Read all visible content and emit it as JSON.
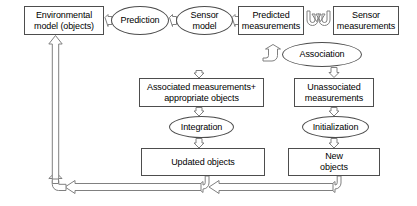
{
  "diagram": {
    "stroke_color": "#4d4d4d",
    "arrow_color": "#808080",
    "text_color": "#000000",
    "background": "#ffffff",
    "nodes": [
      {
        "id": "environmental-model",
        "label": "Environmental\nmodel (objects)",
        "shape": "box",
        "x": 24,
        "y": 6,
        "w": 80,
        "h": 29
      },
      {
        "id": "prediction",
        "label": "Prediction",
        "shape": "ellipse",
        "x": 111,
        "y": 6,
        "w": 58,
        "h": 29
      },
      {
        "id": "sensor-model",
        "label": "Sensor\nmodel",
        "shape": "ellipse",
        "x": 176,
        "y": 6,
        "w": 57,
        "h": 29
      },
      {
        "id": "predicted-measurements",
        "label": "Predicted\nmeasurements",
        "shape": "box",
        "x": 238,
        "y": 6,
        "w": 66,
        "h": 29
      },
      {
        "id": "sensor-measurements",
        "label": "Sensor\nmeasurements",
        "shape": "box",
        "x": 333,
        "y": 6,
        "w": 66,
        "h": 29
      },
      {
        "id": "association",
        "label": "Association",
        "shape": "ellipse",
        "x": 282,
        "y": 42,
        "w": 80,
        "h": 25
      },
      {
        "id": "associated-measurements",
        "label": "Associated measurements+\nappropriate objects",
        "shape": "box",
        "x": 139,
        "y": 78,
        "w": 125,
        "h": 29
      },
      {
        "id": "unassociated-measurements",
        "label": "Unassociated\nmeasurements",
        "shape": "box",
        "x": 294,
        "y": 78,
        "w": 80,
        "h": 29
      },
      {
        "id": "integration",
        "label": "Integration",
        "shape": "ellipse",
        "x": 169,
        "y": 116,
        "w": 65,
        "h": 22
      },
      {
        "id": "initialization",
        "label": "Initialization",
        "shape": "ellipse",
        "x": 302,
        "y": 116,
        "w": 67,
        "h": 22
      },
      {
        "id": "updated-objects",
        "label": "Updated objects",
        "shape": "box",
        "x": 141,
        "y": 148,
        "w": 124,
        "h": 28
      },
      {
        "id": "new-objects",
        "label": "New\nobjects",
        "shape": "box",
        "x": 288,
        "y": 148,
        "w": 92,
        "h": 28
      }
    ],
    "edges": [
      {
        "id": "env-to-prediction",
        "from": "environmental-model",
        "to": "prediction",
        "kind": "straight-right"
      },
      {
        "id": "prediction-to-sensor-model",
        "from": "prediction",
        "to": "sensor-model",
        "kind": "straight-right"
      },
      {
        "id": "sensor-model-to-predicted",
        "from": "sensor-model",
        "to": "predicted-measurements",
        "kind": "straight-right"
      },
      {
        "id": "predicted-to-association",
        "from": "predicted-measurements",
        "to": "association",
        "kind": "hook-down"
      },
      {
        "id": "sensor-meas-to-association",
        "from": "sensor-measurements",
        "to": "association",
        "kind": "hook-down"
      },
      {
        "id": "association-to-associated",
        "from": "association",
        "to": "associated-measurements",
        "kind": "straight-down"
      },
      {
        "id": "association-to-unassociated",
        "from": "association",
        "to": "unassociated-measurements",
        "kind": "straight-down"
      },
      {
        "id": "associated-to-integration",
        "from": "associated-measurements",
        "to": "integration",
        "kind": "straight-down"
      },
      {
        "id": "unassociated-to-initialization",
        "from": "unassociated-measurements",
        "to": "initialization",
        "kind": "straight-down"
      },
      {
        "id": "integration-to-updated",
        "from": "integration",
        "to": "updated-objects",
        "kind": "straight-down"
      },
      {
        "id": "initialization-to-new",
        "from": "initialization",
        "to": "new-objects",
        "kind": "straight-down"
      },
      {
        "id": "new-objects-feedback",
        "from": "new-objects",
        "to": "environmental-model",
        "kind": "feedback-loop"
      },
      {
        "id": "updated-objects-feedback",
        "from": "updated-objects",
        "to": "environmental-model",
        "kind": "feedback-loop"
      },
      {
        "id": "feedback-riser",
        "from": "feedback-bus",
        "to": "environmental-model",
        "kind": "vertical-up"
      }
    ]
  }
}
